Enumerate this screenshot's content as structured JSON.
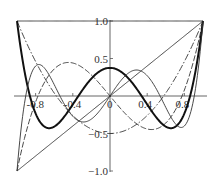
{
  "chart_data": {
    "type": "line",
    "title": "",
    "xlabel": "",
    "ylabel": "",
    "xlim": [
      -1,
      1
    ],
    "ylim": [
      -1,
      1
    ],
    "grid": false,
    "legend": "none",
    "x_ticks": [
      {
        "value": -0.8,
        "label": "-0.8"
      },
      {
        "value": -0.4,
        "label": "-0.4"
      },
      {
        "value": 0,
        "label": "0"
      },
      {
        "value": 0.4,
        "label": "0.4"
      },
      {
        "value": 0.8,
        "label": "0.8"
      }
    ],
    "y_ticks": [
      {
        "value": 1.0,
        "label": "1.0"
      },
      {
        "value": 0.5,
        "label": "0.5"
      },
      {
        "value": -0.5,
        "label": "−0.5"
      },
      {
        "value": -1.0,
        "label": "−1.0"
      }
    ],
    "x": [
      -1.0,
      -0.8,
      -0.6,
      -0.4,
      -0.2,
      0.0,
      0.2,
      0.4,
      0.6,
      0.8,
      1.0
    ],
    "series": [
      {
        "name": "P0",
        "style": "solid-thin",
        "coeffs": [
          1
        ],
        "values": [
          1,
          1,
          1,
          1,
          1,
          1,
          1,
          1,
          1,
          1,
          1
        ]
      },
      {
        "name": "P1",
        "style": "solid-thin",
        "coeffs": [
          0,
          1
        ],
        "values": [
          -1,
          -0.8,
          -0.6,
          -0.4,
          -0.2,
          0,
          0.2,
          0.4,
          0.6,
          0.8,
          1
        ]
      },
      {
        "name": "P2",
        "style": "dash-dot",
        "coeffs": [
          -0.5,
          0,
          1.5
        ],
        "values": [
          1,
          0.46,
          0.04,
          -0.26,
          -0.44,
          -0.5,
          -0.44,
          -0.26,
          0.04,
          0.46,
          1
        ]
      },
      {
        "name": "P3",
        "style": "dashed",
        "coeffs": [
          0,
          -1.5,
          0,
          2.5
        ],
        "values": [
          -1,
          -0.08,
          0.36,
          0.44,
          0.28,
          0,
          -0.28,
          -0.44,
          -0.36,
          0.08,
          1
        ]
      },
      {
        "name": "P4",
        "style": "solid-thick",
        "coeffs": [
          0.375,
          0,
          -3.75,
          0,
          4.375
        ],
        "values": [
          1,
          -0.233,
          -0.408,
          0.113,
          0.232,
          0.375,
          0.232,
          0.113,
          -0.408,
          -0.233,
          1
        ]
      },
      {
        "name": "P5",
        "style": "solid-thin",
        "coeffs": [
          0,
          1.875,
          0,
          -8.75,
          0,
          7.875
        ],
        "values": [
          -1,
          0.397,
          0.153,
          -0.365,
          -0.289,
          0,
          0.289,
          0.365,
          -0.153,
          -0.397,
          1
        ]
      }
    ],
    "colors": {
      "axis": "#555555",
      "line": "#333333",
      "thick": "#111111"
    }
  }
}
